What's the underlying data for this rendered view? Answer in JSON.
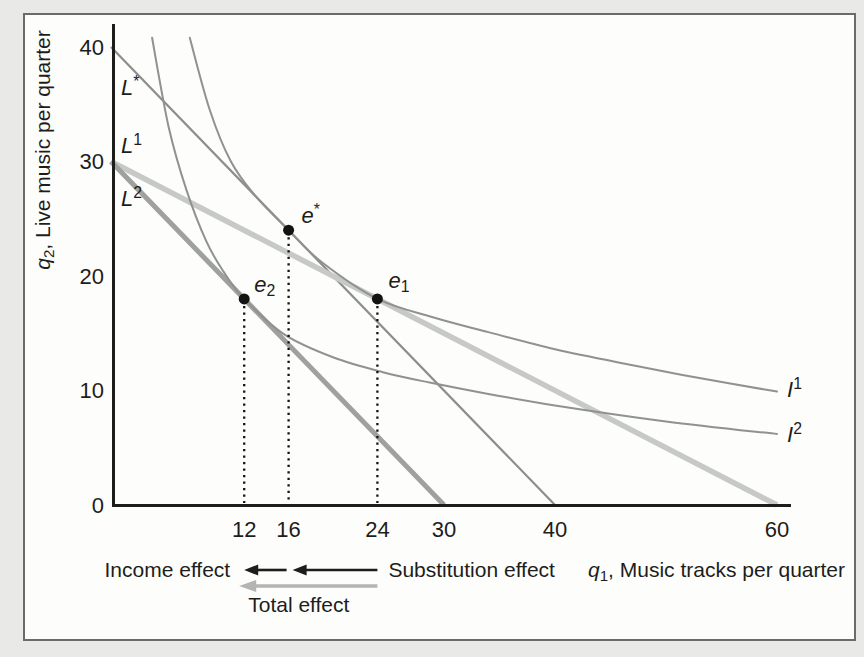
{
  "figure": {
    "outer_bg": "#e9e9e7",
    "frame": {
      "fill": "#fdfdfb",
      "border_color": "#6b6b69"
    }
  },
  "chart_data": {
    "type": "line",
    "title": "",
    "xlabel_parts": [
      {
        "t": "q",
        "style": "italic"
      },
      {
        "t": "1",
        "style": "sub"
      },
      {
        "t": ", Music tracks per quarter"
      }
    ],
    "ylabel_parts": [
      {
        "t": "q",
        "style": "italic"
      },
      {
        "t": "2",
        "style": "sub"
      },
      {
        "t": ", Live music per quarter"
      }
    ],
    "xlim": [
      0,
      61.5
    ],
    "ylim": [
      0,
      42
    ],
    "x_ticks": [
      12,
      16,
      24,
      30,
      40,
      60
    ],
    "y_ticks": [
      0,
      10,
      20,
      30,
      40
    ],
    "grid": false,
    "axis_color": "#1d1d1b",
    "text_color": "#1d1d1b",
    "dot_color": "#131311",
    "budget_lines": [
      {
        "id": "L-star",
        "label_parts": [
          {
            "t": "L",
            "style": "italic"
          },
          {
            "t": "*",
            "style": "sup"
          }
        ],
        "points": [
          [
            0,
            40
          ],
          [
            40,
            0
          ]
        ],
        "color": "#8b8e8a",
        "width": 2.2
      },
      {
        "id": "L1",
        "label_parts": [
          {
            "t": "L",
            "style": "italic"
          },
          {
            "t": "1",
            "style": "sup"
          }
        ],
        "points": [
          [
            0,
            30
          ],
          [
            60,
            0
          ]
        ],
        "color": "#c6c9c5",
        "width": 5.5
      },
      {
        "id": "L2",
        "label_parts": [
          {
            "t": "L",
            "style": "italic"
          },
          {
            "t": "2",
            "style": "sup"
          }
        ],
        "points": [
          [
            0,
            30
          ],
          [
            30,
            0
          ]
        ],
        "color": "#9ea19d",
        "width": 5
      }
    ],
    "indifference_curves": [
      {
        "id": "I1",
        "label_parts": [
          {
            "t": "I",
            "style": "italic"
          },
          {
            "t": "1",
            "style": "sup"
          }
        ],
        "color": "#8f928e",
        "width": 2,
        "points": [
          [
            7.1,
            40.8
          ],
          [
            8.9,
            34.5
          ],
          [
            10.8,
            30
          ],
          [
            13,
            27
          ],
          [
            16,
            24
          ],
          [
            19,
            21.2
          ],
          [
            24,
            18
          ],
          [
            29,
            16.4
          ],
          [
            34,
            15.1
          ],
          [
            40,
            13.6
          ],
          [
            47,
            12.2
          ],
          [
            53.5,
            11
          ],
          [
            60,
            9.9
          ]
        ]
      },
      {
        "id": "I2",
        "label_parts": [
          {
            "t": "I",
            "style": "italic"
          },
          {
            "t": "2",
            "style": "sup"
          }
        ],
        "color": "#8f928e",
        "width": 2,
        "points": [
          [
            3.7,
            40.8
          ],
          [
            5.2,
            33
          ],
          [
            6.8,
            27.5
          ],
          [
            8.6,
            23
          ],
          [
            10.2,
            20.3
          ],
          [
            12,
            18
          ],
          [
            15.6,
            14.9
          ],
          [
            20,
            12.9
          ],
          [
            24.5,
            11.6
          ],
          [
            28.7,
            10.7
          ],
          [
            34,
            9.7
          ],
          [
            40,
            8.7
          ],
          [
            50,
            7.3
          ],
          [
            60,
            6.2
          ]
        ]
      }
    ],
    "equilibrium_points": [
      {
        "id": "e-star",
        "label_parts": [
          {
            "t": "e",
            "style": "italic"
          },
          {
            "t": "*",
            "style": "sup"
          }
        ],
        "q1": 16,
        "q2": 24
      },
      {
        "id": "e1",
        "label_parts": [
          {
            "t": "e",
            "style": "italic"
          },
          {
            "t": "1",
            "style": "sub"
          }
        ],
        "q1": 24,
        "q2": 18
      },
      {
        "id": "e2",
        "label_parts": [
          {
            "t": "e",
            "style": "italic"
          },
          {
            "t": "2",
            "style": "sub"
          }
        ],
        "q1": 12,
        "q2": 18
      }
    ],
    "dropline_xs": [
      12,
      16,
      24
    ]
  },
  "annotations": {
    "income_effect_label": "Income effect",
    "substitution_effect_label": "Substitution effect",
    "total_effect_label": "Total effect",
    "black_arrow_color": "#1d1d1b",
    "gray_arrow_color": "#b3b5b1",
    "income_arrow": {
      "from_q1": 16,
      "to_q1": 12
    },
    "substitution_arrow": {
      "from_q1": 24,
      "to_q1": 16
    },
    "total_arrow": {
      "from_q1": 24,
      "to_q1": 12
    }
  }
}
